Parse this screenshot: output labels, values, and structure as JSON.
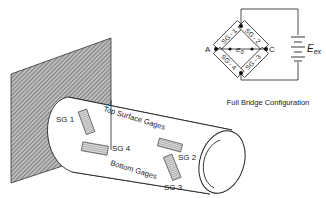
{
  "figure": {
    "title": "Full Bridge Configuration",
    "cantilever": {
      "labels": {
        "sg1": "SG 1",
        "sg2": "SG 2",
        "sg3": "SG 3",
        "sg4": "SG 4",
        "top": "Top Surface Gages",
        "bottom": "Bottom Gages"
      }
    },
    "bridge": {
      "arms": [
        "SG - 1",
        "SG - 2",
        "SG - 3",
        "SG - 4"
      ],
      "node_a": "A",
      "node_c": "C",
      "output": "e",
      "output_sub": "0",
      "source": "E",
      "source_sub": "ex"
    }
  }
}
